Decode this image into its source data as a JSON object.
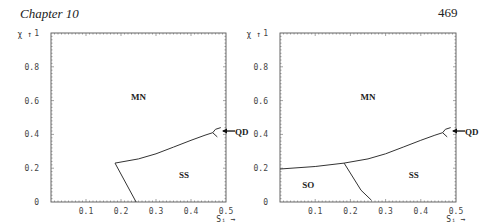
{
  "header": {
    "chapter": "Chapter 10",
    "page_number": "469"
  },
  "chart_data": [
    {
      "type": "line",
      "title": "",
      "xlabel": "S_i →",
      "ylabel": "χ ↑",
      "xlim": [
        0,
        0.5
      ],
      "ylim": [
        0,
        1
      ],
      "x_ticks": [
        "0.1",
        "0.2",
        "0.3",
        "0.4",
        "0.5"
      ],
      "y_ticks": [
        "0",
        "0.2",
        "0.4",
        "0.6",
        "0.8",
        "1"
      ],
      "grid": false,
      "regions": [
        {
          "label": "MN",
          "x": 0.25,
          "y": 0.62
        },
        {
          "label": "SS",
          "x": 0.38,
          "y": 0.16
        },
        {
          "label": "QD",
          "x": 0.5,
          "y": 0.42,
          "annotation": "arrow"
        }
      ],
      "series": [
        {
          "name": "MN-SS boundary",
          "points": [
            [
              0.183,
              0.23
            ],
            [
              0.25,
              0.255
            ],
            [
              0.3,
              0.285
            ],
            [
              0.35,
              0.325
            ],
            [
              0.4,
              0.365
            ],
            [
              0.44,
              0.395
            ],
            [
              0.462,
              0.41
            ]
          ]
        },
        {
          "name": "SS lower boundary",
          "points": [
            [
              0.183,
              0.23
            ],
            [
              0.243,
              0.0
            ]
          ]
        },
        {
          "name": "QD cusp upper",
          "points": [
            [
              0.462,
              0.41
            ],
            [
              0.47,
              0.43
            ],
            [
              0.485,
              0.44
            ]
          ]
        },
        {
          "name": "QD cusp lower",
          "points": [
            [
              0.462,
              0.41
            ],
            [
              0.475,
              0.385
            ]
          ]
        }
      ]
    },
    {
      "type": "line",
      "title": "",
      "xlabel": "S_i →",
      "ylabel": "χ ↑",
      "xlim": [
        0,
        0.5
      ],
      "ylim": [
        0,
        1
      ],
      "x_ticks": [
        "0.1",
        "0.2",
        "0.3",
        "0.4",
        "0.5"
      ],
      "y_ticks": [
        "0",
        "0.2",
        "0.4",
        "0.6",
        "0.8",
        "1"
      ],
      "grid": false,
      "regions": [
        {
          "label": "MN",
          "x": 0.25,
          "y": 0.62
        },
        {
          "label": "SO",
          "x": 0.08,
          "y": 0.1
        },
        {
          "label": "SS",
          "x": 0.38,
          "y": 0.16
        },
        {
          "label": "QD",
          "x": 0.5,
          "y": 0.42,
          "annotation": "arrow"
        }
      ],
      "series": [
        {
          "name": "SO-MN boundary",
          "points": [
            [
              0.0,
              0.195
            ],
            [
              0.1,
              0.21
            ],
            [
              0.182,
              0.23
            ]
          ]
        },
        {
          "name": "MN-SS boundary",
          "points": [
            [
              0.182,
              0.23
            ],
            [
              0.25,
              0.255
            ],
            [
              0.3,
              0.285
            ],
            [
              0.35,
              0.325
            ],
            [
              0.4,
              0.365
            ],
            [
              0.44,
              0.395
            ],
            [
              0.462,
              0.41
            ]
          ]
        },
        {
          "name": "SO-SS boundary",
          "points": [
            [
              0.182,
              0.23
            ],
            [
              0.23,
              0.07
            ],
            [
              0.26,
              0.01
            ]
          ]
        },
        {
          "name": "QD cusp upper",
          "points": [
            [
              0.462,
              0.41
            ],
            [
              0.47,
              0.43
            ],
            [
              0.485,
              0.44
            ]
          ]
        },
        {
          "name": "QD cusp lower",
          "points": [
            [
              0.462,
              0.41
            ],
            [
              0.475,
              0.385
            ]
          ]
        }
      ]
    }
  ]
}
